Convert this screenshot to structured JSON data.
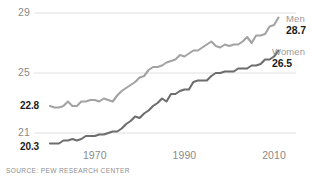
{
  "source_note": "SOURCE: PEW RESEARCH CENTER",
  "axis": {
    "y_ticks": [
      "29",
      "25",
      "21"
    ],
    "x_ticks": [
      "1970",
      "1990",
      "2010"
    ]
  },
  "annotations": {
    "men_name": "Men",
    "men_end_value": "28.7",
    "women_name": "Women",
    "women_end_value": "26.5",
    "men_start_value": "22.8",
    "women_start_value": "20.3"
  },
  "colors": {
    "men_line": "#a3a3a3",
    "women_line": "#6d6d6d",
    "gridline": "#d8d8d8",
    "tick_text": "#8a8a8a",
    "value_text": "#1c1c1c"
  },
  "chart_data": {
    "type": "line",
    "title": "",
    "subtitle": "",
    "xlabel": "",
    "ylabel": "",
    "xlim": [
      1960,
      2012
    ],
    "ylim": [
      20,
      29.4
    ],
    "grid": "horizontal",
    "y_tick_values": [
      29,
      25,
      21
    ],
    "x_tick_values": [
      1970,
      1990,
      2010
    ],
    "legend_position": "right-inline",
    "annotations": [
      {
        "text": "22.8",
        "x": 1960,
        "y": 22.8,
        "series": "Men",
        "role": "start-value"
      },
      {
        "text": "20.3",
        "x": 1960,
        "y": 20.3,
        "series": "Women",
        "role": "start-value"
      },
      {
        "text": "28.7",
        "x": 2011,
        "y": 28.7,
        "series": "Men",
        "role": "end-value"
      },
      {
        "text": "26.5",
        "x": 2011,
        "y": 26.5,
        "series": "Women",
        "role": "end-value"
      }
    ],
    "x": [
      1960,
      1961,
      1962,
      1963,
      1964,
      1965,
      1966,
      1967,
      1968,
      1969,
      1970,
      1971,
      1972,
      1973,
      1974,
      1975,
      1976,
      1977,
      1978,
      1979,
      1980,
      1981,
      1982,
      1983,
      1984,
      1985,
      1986,
      1987,
      1988,
      1989,
      1990,
      1991,
      1992,
      1993,
      1994,
      1995,
      1996,
      1997,
      1998,
      1999,
      2000,
      2001,
      2002,
      2003,
      2004,
      2005,
      2006,
      2007,
      2008,
      2009,
      2010,
      2011
    ],
    "series": [
      {
        "name": "Men",
        "color": "#a3a3a3",
        "values": [
          22.8,
          22.7,
          22.7,
          22.8,
          23.1,
          22.8,
          22.8,
          23.1,
          23.1,
          23.2,
          23.2,
          23.1,
          23.3,
          23.2,
          23.1,
          23.5,
          23.8,
          24.0,
          24.2,
          24.4,
          24.7,
          24.8,
          25.2,
          25.4,
          25.4,
          25.5,
          25.7,
          25.8,
          25.9,
          26.2,
          26.1,
          26.3,
          26.5,
          26.5,
          26.7,
          26.9,
          27.1,
          26.8,
          26.7,
          26.9,
          26.8,
          26.9,
          26.9,
          27.1,
          27.4,
          27.0,
          27.5,
          27.5,
          27.6,
          28.1,
          28.2,
          28.7
        ]
      },
      {
        "name": "Women",
        "color": "#6d6d6d",
        "values": [
          20.3,
          20.3,
          20.3,
          20.5,
          20.5,
          20.6,
          20.5,
          20.6,
          20.8,
          20.8,
          20.8,
          20.9,
          20.9,
          21.0,
          21.1,
          21.1,
          21.3,
          21.6,
          21.8,
          22.1,
          22.0,
          22.3,
          22.5,
          22.8,
          23.0,
          23.3,
          23.1,
          23.6,
          23.6,
          23.8,
          23.9,
          23.9,
          24.4,
          24.5,
          24.5,
          24.5,
          24.8,
          25.0,
          25.0,
          25.1,
          25.1,
          25.1,
          25.3,
          25.3,
          25.3,
          25.5,
          25.5,
          25.6,
          25.9,
          25.9,
          26.1,
          26.5
        ]
      }
    ]
  }
}
